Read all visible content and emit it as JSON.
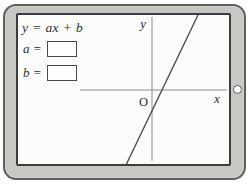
{
  "device": {
    "type": "tablet",
    "bezel_color": "#c7c7c3",
    "bezel_outline_color": "#5f5f5f",
    "screen_background": "#fcfcfa",
    "screen_border_color": "#3d3d3d",
    "ink_color": "#2e2e2e"
  },
  "panel": {
    "equation": "y = ax + b",
    "fields": [
      {
        "label": "a =",
        "value": ""
      },
      {
        "label": "b =",
        "value": ""
      }
    ]
  },
  "graph": {
    "y_axis_label": "y",
    "x_axis_label": "x",
    "origin_label": "O",
    "axis_color": "#8c8c8c",
    "line_color": "#474747",
    "y_axis": {
      "x1": 134,
      "y1": 2,
      "x2": 134,
      "y2": 146
    },
    "x_axis": {
      "x1": 62,
      "y1": 75,
      "x2": 209,
      "y2": 75
    },
    "line": {
      "x1": 108,
      "y1": 150,
      "x2": 180,
      "y2": 0
    },
    "description": "straight line with positive slope crossing the x-axis just right of the origin and the y-axis below the origin"
  }
}
